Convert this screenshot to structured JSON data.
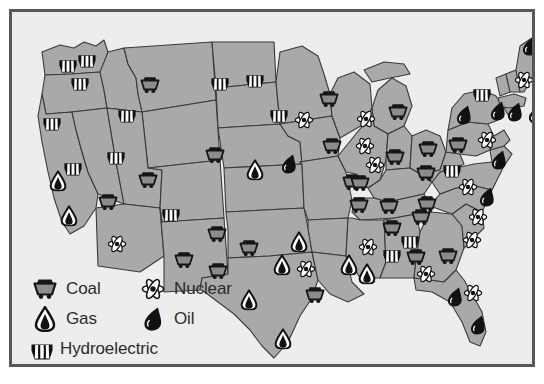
{
  "map": {
    "background_color": "#ecedec",
    "state_fill": "#a9a9a9",
    "state_stroke": "#3a3a3a",
    "border_color": "#55585c"
  },
  "legend": {
    "rows": [
      {
        "left": {
          "icon": "coal-icon",
          "label": "Coal"
        },
        "right": {
          "icon": "nuclear-icon",
          "label": "Nuclear"
        }
      },
      {
        "left": {
          "icon": "gas-icon",
          "label": "Gas"
        },
        "right": {
          "icon": "oil-icon",
          "label": "Oil"
        }
      },
      {
        "left": {
          "icon": "hydroelectric-icon",
          "label": "Hydroelectric"
        },
        "right": null
      }
    ]
  },
  "symbol_colors": {
    "coal": "#8c8c8c",
    "coal_outline": "#161616",
    "gas": "#ffffff",
    "gas_outline": "#111111",
    "oil": "#111111",
    "nuclear": "#ffffff",
    "nuclear_outline": "#141414",
    "hydro": "#ffffff",
    "hydro_outline": "#111111"
  },
  "markers": [
    {
      "type": "hydroelectric",
      "state": "Washington",
      "x": 56,
      "y": 52
    },
    {
      "type": "hydroelectric",
      "state": "Washington",
      "x": 75,
      "y": 47
    },
    {
      "type": "hydroelectric",
      "state": "Washington",
      "x": 68,
      "y": 70
    },
    {
      "type": "hydroelectric",
      "state": "Oregon",
      "x": 40,
      "y": 110
    },
    {
      "type": "hydroelectric",
      "state": "Idaho",
      "x": 115,
      "y": 102
    },
    {
      "type": "coal",
      "state": "Montana",
      "x": 138,
      "y": 73
    },
    {
      "type": "hydroelectric",
      "state": "Montana",
      "x": 208,
      "y": 70
    },
    {
      "type": "hydroelectric",
      "state": "NorthDakota",
      "x": 243,
      "y": 67
    },
    {
      "type": "coal",
      "state": "NorthDakota",
      "x": 317,
      "y": 87
    },
    {
      "type": "hydroelectric",
      "state": "SouthDakota",
      "x": 267,
      "y": 102
    },
    {
      "type": "nuclear",
      "state": "Nebraska",
      "x": 292,
      "y": 108
    },
    {
      "type": "coal",
      "state": "Minnesota",
      "x": 320,
      "y": 134
    },
    {
      "type": "nuclear",
      "state": "Minnesota",
      "x": 354,
      "y": 107
    },
    {
      "type": "nuclear",
      "state": "Wisconsin",
      "x": 353,
      "y": 134
    },
    {
      "type": "coal",
      "state": "Michigan",
      "x": 386,
      "y": 100
    },
    {
      "type": "nuclear",
      "state": "Illinois",
      "x": 363,
      "y": 153
    },
    {
      "type": "coal",
      "state": "Illinois",
      "x": 383,
      "y": 145
    },
    {
      "type": "coal",
      "state": "Indiana",
      "x": 416,
      "y": 137
    },
    {
      "type": "coal",
      "state": "Ohio",
      "x": 446,
      "y": 133
    },
    {
      "type": "coal",
      "state": "Ohio",
      "x": 414,
      "y": 161
    },
    {
      "type": "hydroelectric",
      "state": "NewYork",
      "x": 470,
      "y": 81
    },
    {
      "type": "oil",
      "state": "NewYork",
      "x": 452,
      "y": 103
    },
    {
      "type": "oil",
      "state": "Pennsylvania",
      "x": 486,
      "y": 99
    },
    {
      "type": "nuclear",
      "state": "Vermont",
      "x": 512,
      "y": 68
    },
    {
      "type": "oil",
      "state": "Maine",
      "x": 518,
      "y": 34
    },
    {
      "type": "oil",
      "state": "Massachusetts",
      "x": 503,
      "y": 100
    },
    {
      "type": "oil",
      "state": "NewJersey",
      "x": 524,
      "y": 102
    },
    {
      "type": "nuclear",
      "state": "NewJersey",
      "x": 475,
      "y": 128
    },
    {
      "type": "oil",
      "state": "Delaware",
      "x": 487,
      "y": 148
    },
    {
      "type": "hydroelectric",
      "state": "NewYork2",
      "x": 440,
      "y": 157
    },
    {
      "type": "coal",
      "state": "WestVirginia",
      "x": 415,
      "y": 192
    },
    {
      "type": "nuclear",
      "state": "Virginia",
      "x": 456,
      "y": 175
    },
    {
      "type": "oil",
      "state": "Virginia",
      "x": 475,
      "y": 185
    },
    {
      "type": "nuclear",
      "state": "NorthCarolina",
      "x": 466,
      "y": 205
    },
    {
      "type": "coal",
      "state": "Kentucky",
      "x": 377,
      "y": 194
    },
    {
      "type": "coal",
      "state": "Kentucky",
      "x": 409,
      "y": 205
    },
    {
      "type": "coal",
      "state": "Tennessee",
      "x": 380,
      "y": 216
    },
    {
      "type": "coal",
      "state": "Missouri",
      "x": 347,
      "y": 193
    },
    {
      "type": "coal",
      "state": "Iowa",
      "x": 340,
      "y": 170
    },
    {
      "type": "coal",
      "state": "Iowa",
      "x": 348,
      "y": 171
    },
    {
      "type": "nuclear",
      "state": "SouthCarolina",
      "x": 460,
      "y": 228
    },
    {
      "type": "coal",
      "state": "Georgia",
      "x": 436,
      "y": 244
    },
    {
      "type": "hydroelectric",
      "state": "Alabama",
      "x": 398,
      "y": 228
    },
    {
      "type": "coal",
      "state": "Alabama",
      "x": 404,
      "y": 245
    },
    {
      "type": "nuclear",
      "state": "Alabama",
      "x": 414,
      "y": 262
    },
    {
      "type": "nuclear",
      "state": "Mississippi",
      "x": 356,
      "y": 235
    },
    {
      "type": "hydroelectric",
      "state": "Mississippi",
      "x": 380,
      "y": 242
    },
    {
      "type": "gas",
      "state": "Louisiana",
      "x": 355,
      "y": 262
    },
    {
      "type": "gas",
      "state": "Louisiana",
      "x": 337,
      "y": 253
    },
    {
      "type": "oil",
      "state": "Florida",
      "x": 443,
      "y": 285
    },
    {
      "type": "nuclear",
      "state": "Florida",
      "x": 461,
      "y": 281
    },
    {
      "type": "oil",
      "state": "Florida",
      "x": 466,
      "y": 313
    },
    {
      "type": "coal",
      "state": "Arkansas",
      "x": 303,
      "y": 283
    },
    {
      "type": "nuclear",
      "state": "Oklahoma",
      "x": 294,
      "y": 257
    },
    {
      "type": "gas",
      "state": "Oklahoma",
      "x": 287,
      "y": 230
    },
    {
      "type": "coal",
      "state": "Kansas",
      "x": 237,
      "y": 236
    },
    {
      "type": "gas",
      "state": "Texas",
      "x": 270,
      "y": 253
    },
    {
      "type": "gas",
      "state": "Texas",
      "x": 237,
      "y": 288
    },
    {
      "type": "gas",
      "state": "Texas",
      "x": 271,
      "y": 327
    },
    {
      "type": "coal",
      "state": "NewMexico",
      "x": 206,
      "y": 259
    },
    {
      "type": "coal",
      "state": "NewMexico",
      "x": 172,
      "y": 248
    },
    {
      "type": "hydroelectric",
      "state": "Colorado",
      "x": 159,
      "y": 201
    },
    {
      "type": "coal",
      "state": "Colorado",
      "x": 205,
      "y": 222
    },
    {
      "type": "coal",
      "state": "Utah",
      "x": 136,
      "y": 168
    },
    {
      "type": "coal",
      "state": "Nevada",
      "x": 96,
      "y": 190
    },
    {
      "type": "hydroelectric",
      "state": "Nevada",
      "x": 104,
      "y": 144
    },
    {
      "type": "nuclear",
      "state": "Arizona",
      "x": 105,
      "y": 232
    },
    {
      "type": "gas",
      "state": "California",
      "x": 46,
      "y": 169
    },
    {
      "type": "gas",
      "state": "California",
      "x": 57,
      "y": 204
    },
    {
      "type": "hydroelectric",
      "state": "California",
      "x": 61,
      "y": 155
    },
    {
      "type": "coal",
      "state": "Wyoming",
      "x": 203,
      "y": 143
    },
    {
      "type": "gas",
      "state": "Wyoming",
      "x": 243,
      "y": 158
    },
    {
      "type": "oil",
      "state": "Nebraska",
      "x": 277,
      "y": 152
    }
  ]
}
